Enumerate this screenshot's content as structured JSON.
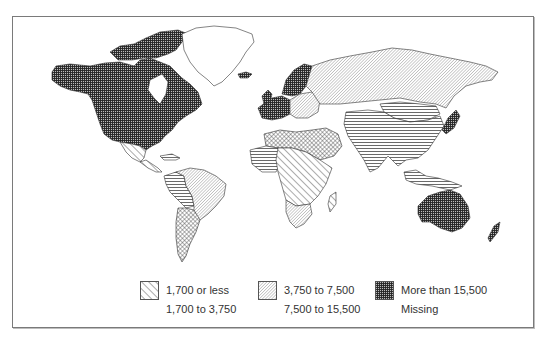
{
  "map": {
    "type": "choropleth-world",
    "regions": [
      {
        "name": "North America (USA, Canada)",
        "category": "More than 15,500"
      },
      {
        "name": "Greenland",
        "category": "Missing"
      },
      {
        "name": "Mexico",
        "category": "1,700 or less"
      },
      {
        "name": "Central America & Caribbean",
        "category": "1,700 or less"
      },
      {
        "name": "Brazil / Eastern South America",
        "category": "3,750 to 7,500"
      },
      {
        "name": "Andean South America",
        "category": "1,700 to 3,750"
      },
      {
        "name": "Southern Cone (Argentina, Chile)",
        "category": "7,500 to 15,500"
      },
      {
        "name": "Western Europe & Scandinavia",
        "category": "More than 15,500"
      },
      {
        "name": "Eastern Europe",
        "category": "3,750 to 7,500"
      },
      {
        "name": "Russia / Northern Asia",
        "category": "3,750 to 7,500"
      },
      {
        "name": "North Africa & Middle East",
        "category": "7,500 to 15,500"
      },
      {
        "name": "Sub-Saharan Africa",
        "category": "1,700 or less"
      },
      {
        "name": "West Africa",
        "category": "1,700 to 3,750"
      },
      {
        "name": "Southern Africa",
        "category": "3,750 to 7,500"
      },
      {
        "name": "China / South & Southeast Asia",
        "category": "1,700 to 3,750"
      },
      {
        "name": "Central Asia / Mongolia",
        "category": "1,700 to 3,750"
      },
      {
        "name": "Japan",
        "category": "More than 15,500"
      },
      {
        "name": "Australia",
        "category": "More than 15,500"
      },
      {
        "name": "New Zealand",
        "category": "More than 15,500"
      }
    ]
  },
  "legend": {
    "items": [
      {
        "id": "l1",
        "label": "1,700 or less",
        "pattern": "diagonal-hatch"
      },
      {
        "id": "l2",
        "label": "1,700 to 3,750",
        "pattern": "horizontal-lines"
      },
      {
        "id": "l3",
        "label": "3,750 to 7,500",
        "pattern": "fine-diagonal"
      },
      {
        "id": "l4",
        "label": "7,500 to 15,500",
        "pattern": "crosshatch-diamond"
      },
      {
        "id": "l5",
        "label": "More than 15,500",
        "pattern": "dense-grid"
      },
      {
        "id": "l6",
        "label": "Missing",
        "pattern": "blank"
      }
    ]
  },
  "colors": {
    "ink": "#333333",
    "frame": "#7a7a7a",
    "background": "#ffffff"
  }
}
